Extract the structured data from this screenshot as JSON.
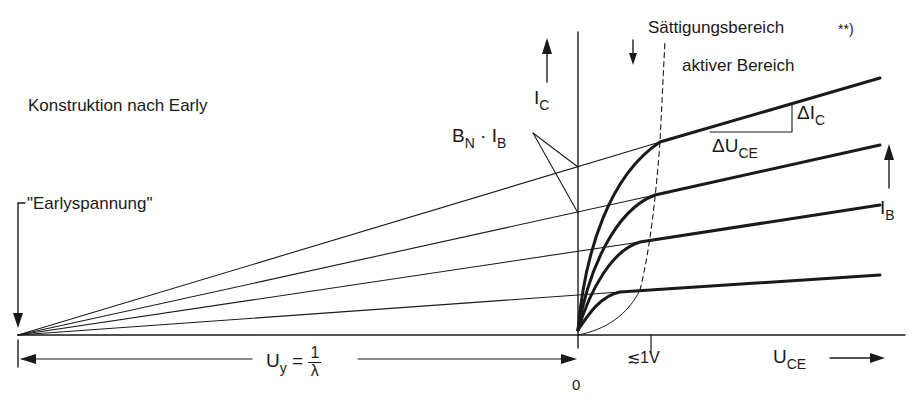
{
  "diagram": {
    "type": "transistor-output-characteristics-early-construction",
    "labels": {
      "construction_title": "Konstruktion nach Early",
      "early_voltage": "\"Earlyspannung\"",
      "saturation_region": "Sättigungsbereich",
      "footnote_marker": "**)",
      "active_region": "aktiver Bereich",
      "ic_axis_main": "I",
      "ic_axis_sub": "C",
      "bn_ib_main1": "B",
      "bn_ib_sub1": "N",
      "bn_ib_dot": " · I",
      "bn_ib_sub2": "B",
      "delta_ic_main": "ΔI",
      "delta_ic_sub": "C",
      "delta_uce_main": "ΔU",
      "delta_uce_sub": "CE",
      "ib_main": "I",
      "ib_sub": "B",
      "uy_main": "U",
      "uy_sub": "y",
      "uy_eq": " = ",
      "uy_num": "1",
      "uy_den": "λ",
      "origin": "0",
      "sat_voltage": "≲1V",
      "uce_main": "U",
      "uce_sub": "CE",
      "uce_arrow": "⟶"
    },
    "colors": {
      "ink": "#1a1a1a",
      "background": "#ffffff"
    }
  }
}
